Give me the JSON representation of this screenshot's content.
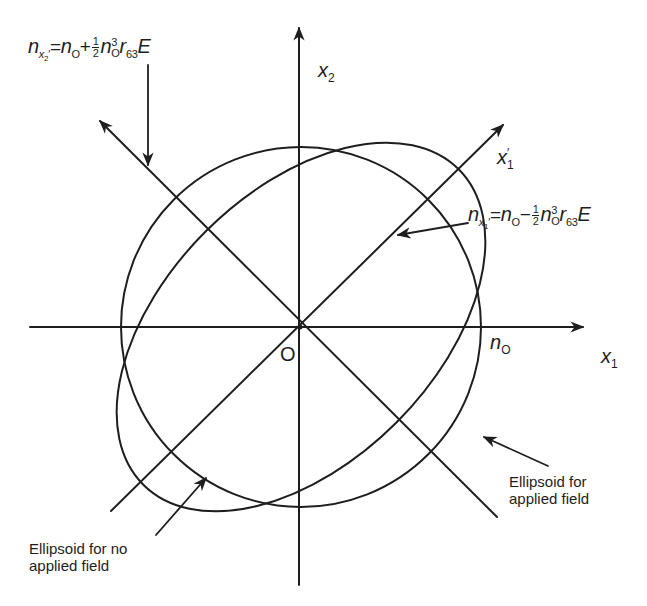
{
  "diagram": {
    "colors": {
      "ink": "#1e1e1e",
      "background": "#ffffff"
    },
    "origin": {
      "label": "O"
    },
    "axes": {
      "x1": {
        "var": "x",
        "sub": "1"
      },
      "x2": {
        "var": "x",
        "sub": "2"
      },
      "x1_prime": {
        "var": "x",
        "sub": "1",
        "prime": "′"
      },
      "x2_prime": {
        "var": "x",
        "sub": "2",
        "prime": "′"
      }
    },
    "intercept_label": {
      "var": "n",
      "sub": "O"
    },
    "equation_top": {
      "lhs_var": "n",
      "lhs_sub": "x",
      "lhs_subsub": "2",
      "lhs_prime": "′",
      "eq": "=",
      "n0_var": "n",
      "n0_sub": "O",
      "op": "+",
      "frac_num": "1",
      "frac_den": "2",
      "n03_var": "n",
      "n03_sup": "3",
      "n03_sub": "O",
      "r_var": "r",
      "r_sub": "63",
      "field": "E"
    },
    "equation_right": {
      "lhs_var": "n",
      "lhs_sub": "x",
      "lhs_subsub": "1",
      "lhs_prime": "′",
      "eq": "=",
      "n0_var": "n",
      "n0_sub": "O",
      "op": "−",
      "frac_num": "1",
      "frac_den": "2",
      "n03_var": "n",
      "n03_sup": "3",
      "n03_sub": "O",
      "r_var": "r",
      "r_sub": "63",
      "field": "E"
    },
    "captions": {
      "applied": [
        "Ellipsoid for",
        "applied field"
      ],
      "no_applied": [
        "Ellipsoid for no",
        "applied field"
      ]
    },
    "shapes": {
      "circle_no_field": {
        "cx": 301,
        "cy": 327,
        "r": 180
      },
      "ellipse_applied_field": {
        "cx": 301,
        "cy": 327,
        "semi_major": 223,
        "semi_minor": 135,
        "rotation_deg": 45
      }
    }
  }
}
